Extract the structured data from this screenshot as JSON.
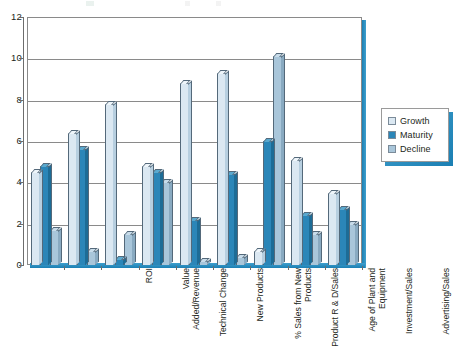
{
  "chart_data": {
    "type": "bar",
    "title": "",
    "subtitle": "",
    "xlabel": "",
    "ylabel": "",
    "ylim": [
      0,
      12
    ],
    "yticks": [
      0,
      2,
      4,
      6,
      8,
      10,
      12
    ],
    "grid": true,
    "legend_position": "right",
    "categories": [
      "ROI",
      "Value\nAdded/Revenue",
      "Technical Change",
      "New Products",
      "% Sales from New\nProducts",
      "Product R & D/Sales",
      "Age of Plant and\nEquipment",
      "Investment/Sales",
      "Advertising/Sales"
    ],
    "series": [
      {
        "name": "Growth",
        "color": "#dbe8f2",
        "values": [
          4.5,
          6.4,
          7.8,
          4.8,
          8.8,
          9.3,
          0.7,
          5.1,
          3.5
        ]
      },
      {
        "name": "Maturity",
        "color": "#2b86b8",
        "values": [
          4.8,
          5.6,
          0.3,
          4.5,
          2.2,
          4.4,
          6.0,
          2.4,
          2.7
        ]
      },
      {
        "name": "Decline",
        "color": "#a9c6da",
        "values": [
          1.7,
          0.7,
          1.5,
          4.0,
          0.2,
          0.4,
          10.1,
          1.5,
          2.0
        ]
      }
    ]
  },
  "legend": {
    "items": [
      {
        "label": "Growth",
        "swatch": "s-growth"
      },
      {
        "label": "Maturity",
        "swatch": "s-maturity"
      },
      {
        "label": "Decline",
        "swatch": "s-decline"
      }
    ]
  },
  "colors": {
    "growth": "#dbe8f2",
    "maturity": "#2b86b8",
    "decline": "#a9c6da",
    "frame": "#8a8a8a",
    "accent_blue": "#1b7fb3",
    "text": "#231f20"
  }
}
